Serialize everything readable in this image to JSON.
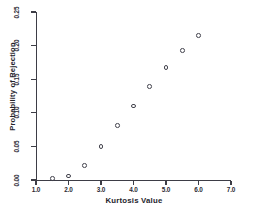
{
  "chart_data": {
    "type": "scatter",
    "title": "",
    "xlabel": "Kurtosis Value",
    "ylabel": "Probability of Rejection",
    "xlim": [
      1.0,
      7.0
    ],
    "ylim": [
      0.0,
      0.25
    ],
    "xticks": [
      "1.0",
      "2.0",
      "3.0",
      "4.0",
      "5.0",
      "6.0",
      "7.0"
    ],
    "xtick_values": [
      1.0,
      2.0,
      3.0,
      4.0,
      5.0,
      6.0,
      7.0
    ],
    "yticks": [
      "0.00",
      "0.05",
      "0.10",
      "0.15",
      "0.20",
      "0.25"
    ],
    "ytick_values": [
      0.0,
      0.05,
      0.1,
      0.15,
      0.2,
      0.25
    ],
    "grid": false,
    "legend": null,
    "marker": "open-circle",
    "marker_color": "#43434d",
    "x": [
      1.5,
      2.0,
      2.5,
      3.0,
      3.5,
      4.0,
      4.5,
      5.0,
      5.5,
      6.0
    ],
    "y": [
      0.002,
      0.006,
      0.022,
      0.05,
      0.081,
      0.11,
      0.139,
      0.167,
      0.193,
      0.215
    ],
    "points": [
      {
        "x": 1.5,
        "y": 0.002
      },
      {
        "x": 2.0,
        "y": 0.006
      },
      {
        "x": 2.5,
        "y": 0.022
      },
      {
        "x": 3.0,
        "y": 0.05
      },
      {
        "x": 3.5,
        "y": 0.081
      },
      {
        "x": 4.0,
        "y": 0.11
      },
      {
        "x": 4.5,
        "y": 0.139
      },
      {
        "x": 5.0,
        "y": 0.167
      },
      {
        "x": 5.5,
        "y": 0.193
      },
      {
        "x": 6.0,
        "y": 0.215
      }
    ]
  },
  "colors": {
    "background": "#ffffff",
    "axis": "#3d3d46",
    "text": "#24242c",
    "marker": "#43434d"
  }
}
